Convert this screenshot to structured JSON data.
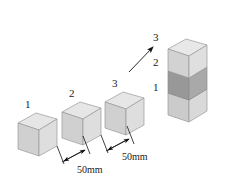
{
  "figure": {
    "background_color": "#ffffff",
    "width": 228,
    "height": 189
  },
  "colors": {
    "cube_top_face": "#e4e4e4",
    "cube_left_face": "#cfcfcf",
    "cube_right_face": "#dcdcdc",
    "cube_dark_top_face": "#bdbdbd",
    "cube_dark_left_face": "#9a9a9a",
    "cube_dark_right_face": "#ababab",
    "outline": "#8a8a8a",
    "ink": "#1a1a1a"
  },
  "row_cubes": [
    {
      "label": "1",
      "name": "cube-one"
    },
    {
      "label": "2",
      "name": "cube-two"
    },
    {
      "label": "3",
      "name": "cube-three"
    }
  ],
  "dimensions": [
    {
      "label": "50mm",
      "name": "dimension-gap-one"
    },
    {
      "label": "50mm",
      "name": "dimension-gap-two"
    }
  ],
  "stack_labels": [
    {
      "label": "3",
      "name": "stack-label-three"
    },
    {
      "label": "2",
      "name": "stack-label-two"
    },
    {
      "label": "1",
      "name": "stack-label-one"
    }
  ],
  "stack_cubes": [
    {
      "label": "3",
      "shade": "light",
      "name": "stack-cube-three"
    },
    {
      "label": "2",
      "shade": "dark",
      "name": "stack-cube-two"
    },
    {
      "label": "1",
      "shade": "light",
      "name": "stack-cube-one"
    }
  ],
  "arrow": {
    "name": "stacking-arrow",
    "direction": "up-right"
  }
}
